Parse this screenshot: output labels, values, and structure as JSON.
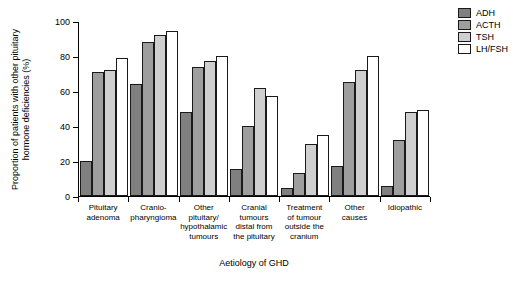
{
  "chart_data": {
    "type": "bar",
    "title": "",
    "xlabel": "Aetiology of GHD",
    "ylabel": "Proportion of patients with other pituitary hormone deficiencies (%)",
    "ylim": [
      0,
      100
    ],
    "yticks": [
      0,
      20,
      40,
      60,
      80,
      100
    ],
    "grid": false,
    "legend_position": "top-right",
    "categories": [
      "Pituitary adenoma",
      "Cranio-pharyngioma",
      "Other pituitary/hypothalamic tumours",
      "Cranial tumours distal from the pituitary",
      "Treatment of tumour outside the cranium",
      "Other causes",
      "Idiopathic"
    ],
    "category_lines": [
      [
        "Pituitary",
        "adenoma"
      ],
      [
        "Cranio-",
        "pharyngioma"
      ],
      [
        "Other",
        "pituitary/",
        "hypothalamic",
        "tumours"
      ],
      [
        "Cranial",
        "tumours",
        "distal from",
        "the pituitary"
      ],
      [
        "Treatment",
        "of tumour",
        "outside the",
        "cranium"
      ],
      [
        "Other",
        "causes"
      ],
      [
        "Idiopathic"
      ]
    ],
    "series": [
      {
        "name": "ADH",
        "color": "#808080",
        "values": [
          20,
          64,
          48,
          15.5,
          4.5,
          17,
          5.5
        ]
      },
      {
        "name": "ACTH",
        "color": "#9e9e9e",
        "values": [
          71,
          88,
          74,
          40,
          13,
          65,
          32
        ]
      },
      {
        "name": "TSH",
        "color": "#cfcfcf",
        "values": [
          72,
          92,
          77,
          62,
          30,
          72,
          48
        ]
      },
      {
        "name": "LH/FSH",
        "color": "#ffffff",
        "values": [
          79,
          94.5,
          80,
          57,
          35,
          80,
          49
        ]
      }
    ]
  }
}
